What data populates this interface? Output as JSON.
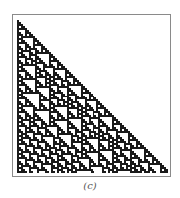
{
  "figure": {
    "label": "(c)",
    "rule": 110,
    "steps": 76,
    "cell_color": "#1a1a1a",
    "background_color": "#ffffff",
    "frame_color": "#8a8a8a"
  }
}
